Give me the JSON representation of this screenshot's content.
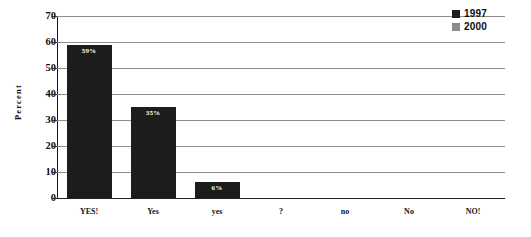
{
  "chart_data": {
    "type": "bar",
    "title": "",
    "subtitle": "",
    "xlabel": "",
    "ylabel": "Percent",
    "categories": [
      "YES!",
      "Yes",
      "yes",
      "?",
      "no",
      "No",
      "NO!"
    ],
    "series": [
      {
        "name": "1997",
        "color": "#1c1c1c",
        "values": [
          59,
          35,
          6,
          null,
          null,
          null,
          null
        ],
        "data_labels": [
          "59%",
          "35%",
          "6%",
          "",
          "",
          "",
          ""
        ]
      },
      {
        "name": "2000",
        "color": "#8c8c8c",
        "values": [
          null,
          null,
          null,
          null,
          null,
          null,
          null
        ],
        "data_labels": [
          "",
          "",
          "",
          "",
          "",
          "",
          ""
        ]
      }
    ],
    "ylim": [
      0,
      70
    ],
    "yticks": [
      0,
      10,
      20,
      30,
      40,
      50,
      60,
      70
    ],
    "ytick_labels": [
      "0",
      "10",
      "20",
      "30",
      "40",
      "50",
      "60",
      "70"
    ],
    "grid": true,
    "grid_axis": "y",
    "legend_position": "top-right",
    "legend_entries": [
      {
        "label": "1997",
        "swatch_color": "#1c1c1c"
      },
      {
        "label": "2000",
        "swatch_color": "#8c8c8c"
      }
    ]
  },
  "axis": {
    "y_title": "Percent"
  },
  "colors": {
    "background": "#ffffff",
    "bar_1997": "#1c1c1c",
    "bar_2000": "#8c8c8c",
    "gridline": "#8e8e8e",
    "axis": "#1a1a1a",
    "text": "#111111",
    "bar_label_text": "#ffffff"
  }
}
